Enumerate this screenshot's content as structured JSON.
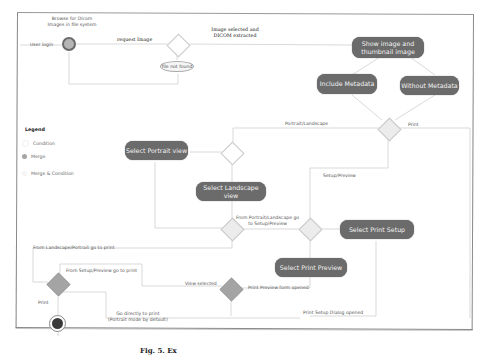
{
  "diagram": {
    "type": "UML activity diagram",
    "start_note": "Browse for Dicom\nImages in file system",
    "actor_label": "User login",
    "nodes": {
      "show_image": "Show image and\nthumbnail image",
      "include_metadata": "Include Metadata",
      "without_metadata": "Without Metadata",
      "select_portrait": "Select Portrait view",
      "select_landscape": "Select Landscape view",
      "select_print_setup": "Select Print Setup",
      "select_print_preview": "Select Print Preview",
      "file_not_found": "file not found"
    },
    "edges": {
      "request_image": "request Image",
      "image_selected": "Image selected and\nDICOM extracted",
      "portrait_landscape": "Portrait/Landscape",
      "print": "Print",
      "setup_preview": "Setup/Preview",
      "from_portrait_landscape_to_setup": "From Portrait/Landscape go\nto Setup/Preview",
      "from_landscape_portrait_to_print": "From Landscape/Portrait go to print",
      "from_setup_preview_to_print": "From Setup/Preview go to print",
      "view_selected": "View selected",
      "print_preview_form_opened": "Print Preview form opened",
      "print_setup_dialog_opened": "Print Setup Dialog opened",
      "go_directly_to_print": "Go directly to print\n(Portrait mode by default)",
      "print_final": "Print"
    },
    "legend": {
      "title": "Legend",
      "items": [
        {
          "label": "Condition",
          "color": "#ffffff"
        },
        {
          "label": "Merge",
          "color": "#a4a4a4"
        },
        {
          "label": "Merge & Condition",
          "color": "#ececec"
        }
      ]
    },
    "colors": {
      "node_fill": "#6b6b6b",
      "node_text": "#f2f2f2",
      "line": "#d0d0d0",
      "merge_fill": "#a4a4a4"
    }
  },
  "caption": "Fig. 5. Ex"
}
